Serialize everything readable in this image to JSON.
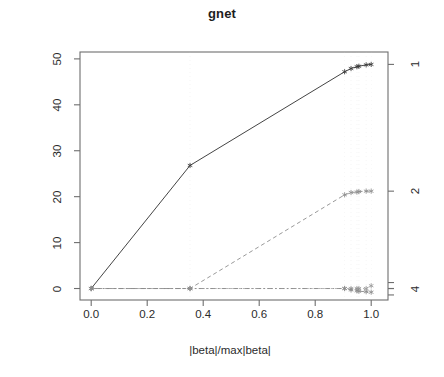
{
  "chart_data": {
    "type": "line",
    "title": "gnet",
    "xlabel": "|beta|/max|beta|",
    "ylabel": "Standardized Coefficients",
    "xlim": [
      -0.04,
      1.06
    ],
    "ylim": [
      -2.5,
      51.5
    ],
    "grid": false,
    "legend": "right-axis-variable-numbers",
    "xticks": [
      "0.0",
      "0.2",
      "0.4",
      "0.6",
      "0.8",
      "1.0"
    ],
    "xtick_values": [
      0.0,
      0.2,
      0.4,
      0.6,
      0.8,
      1.0
    ],
    "yticks": [
      "0",
      "10",
      "20",
      "30",
      "40",
      "50"
    ],
    "ytick_values": [
      0,
      10,
      20,
      30,
      40,
      50
    ],
    "right_axis_labels": [
      "1",
      "2",
      "4"
    ],
    "right_axis_values": [
      48.8,
      21.2,
      0.0
    ],
    "right_axis_extra_ticks": [
      1.3,
      0.0,
      -1.4
    ],
    "series": [
      {
        "name": "1",
        "style": "solid",
        "color": "#3a3a3a",
        "x": [
          0.0,
          0.353,
          0.905,
          0.928,
          0.949,
          0.956,
          0.982,
          1.0
        ],
        "values": [
          0.0,
          26.8,
          47.2,
          47.9,
          48.3,
          48.4,
          48.7,
          48.8
        ]
      },
      {
        "name": "2",
        "style": "dashed",
        "color": "#8d8d8d",
        "x": [
          0.0,
          0.353,
          0.905,
          0.928,
          0.949,
          0.956,
          0.982,
          1.0
        ],
        "values": [
          0.0,
          0.0,
          20.4,
          20.9,
          21.0,
          21.1,
          21.2,
          21.2
        ]
      },
      {
        "name": "3",
        "style": "dotted",
        "color": "#9a9a9a",
        "x": [
          0.0,
          0.353,
          0.905,
          0.928,
          0.949,
          0.956,
          0.982,
          1.0
        ],
        "values": [
          0.0,
          0.0,
          0.0,
          0.0,
          0.0,
          0.0,
          0.0,
          0.6
        ]
      },
      {
        "name": "4",
        "style": "dotdash",
        "color": "#8a8a8a",
        "x": [
          0.0,
          0.353,
          0.905,
          0.928,
          0.949,
          0.956,
          0.982,
          1.0
        ],
        "values": [
          0.0,
          0.0,
          0.0,
          -0.3,
          -0.5,
          -0.6,
          -0.7,
          -0.8
        ]
      }
    ],
    "breakpoints": [
      0.0,
      0.353,
      0.905,
      0.928,
      0.949,
      0.956,
      0.982,
      1.0
    ],
    "point_marker": "asterisk"
  }
}
